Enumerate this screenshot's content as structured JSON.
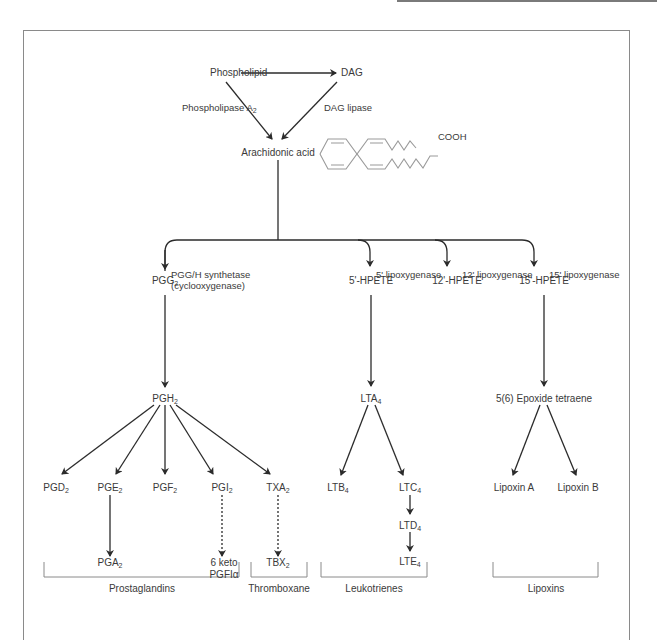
{
  "diagram": {
    "top": {
      "phospholipid": "Phospholipid",
      "dag": "DAG",
      "phospholipase_label": "Phospholipase A",
      "phospholipase_sub": "2",
      "dag_lipase": "DAG lipase",
      "arachidonic_acid": "Arachidonic acid",
      "cooh": "COOH"
    },
    "enzymes": {
      "cox_line1": "PGG/H synthetase",
      "cox_line2": "(cyclooxygenase)",
      "lox5": "5' lipoxygenase",
      "lox12": "12' lipoxygenase",
      "lox15": "15' lipoxygenase"
    },
    "intermediates": {
      "pgg": {
        "base": "PGG",
        "sub": "2"
      },
      "hpete5": "5'-HPETE",
      "hpete12": "12'-HPETE",
      "hpete15": "15'-HPETE",
      "pgh": {
        "base": "PGH",
        "sub": "2"
      },
      "lta": {
        "base": "LTA",
        "sub": "4"
      },
      "epoxide": "5(6) Epoxide tetraene"
    },
    "products": {
      "pgd": {
        "base": "PGD",
        "sub": "2"
      },
      "pge": {
        "base": "PGE",
        "sub": "2"
      },
      "pgf": {
        "base": "PGF",
        "sub": "2"
      },
      "pgi": {
        "base": "PGI",
        "sub": "2"
      },
      "txa": {
        "base": "TXA",
        "sub": "2"
      },
      "pga": {
        "base": "PGA",
        "sub": "2"
      },
      "keto_line1": "6 keto",
      "keto_line2": "PGFIα",
      "tbx": {
        "base": "TBX",
        "sub": "2"
      },
      "ltb": {
        "base": "LTB",
        "sub": "4"
      },
      "ltc": {
        "base": "LTC",
        "sub": "4"
      },
      "ltd": {
        "base": "LTD",
        "sub": "4"
      },
      "lte": {
        "base": "LTE",
        "sub": "4"
      },
      "lipoxin_a": "Lipoxin A",
      "lipoxin_b": "Lipoxin B"
    },
    "groups": {
      "prostaglandins": "Prostaglandins",
      "thromboxane": "Thromboxane",
      "leukotrienes": "Leukotrienes",
      "lipoxins": "Lipoxins"
    },
    "colors": {
      "line": "#2b2b2b",
      "text": "#3a3a3a",
      "bracket": "#8a8a8a",
      "molecule": "#9a9a9a"
    }
  }
}
